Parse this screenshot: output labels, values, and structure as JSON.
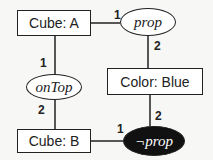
{
  "nodes": {
    "cube_a": "Cube: A",
    "prop": "prop",
    "on_top": "onTop",
    "color_blue": "Color: Blue",
    "cube_b": "Cube: B",
    "neg_prop": "¬prop"
  },
  "edge_labels": {
    "cubeA_prop": "1",
    "prop_color": "2",
    "cubeA_onTop": "1",
    "onTop_cubeB": "2",
    "color_negprop": "2",
    "cubeB_negprop": "1"
  }
}
